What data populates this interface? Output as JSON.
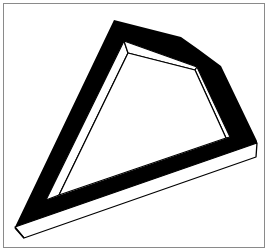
{
  "figure": {
    "colors": {
      "band": "#000000",
      "face": "#ffffff",
      "stroke": "#000000",
      "border": "#8a8a8a",
      "background": "#ffffff"
    }
  }
}
